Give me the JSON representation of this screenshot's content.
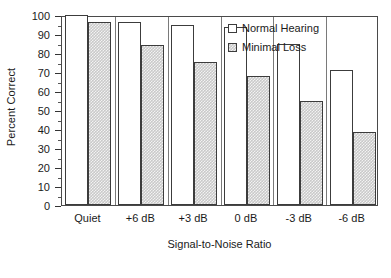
{
  "chart_data": {
    "type": "bar",
    "title": "",
    "xlabel": "Signal-to-Noise Ratio",
    "ylabel": "Percent Correct",
    "categories": [
      "Quiet",
      "+6 dB",
      "+3 dB",
      "0 dB",
      "-3 dB",
      "-6 dB"
    ],
    "series": [
      {
        "name": "Normal Hearing",
        "swatch": "open-square",
        "fill": "#ffffff",
        "values": [
          100,
          96.5,
          95,
          93.5,
          85,
          71
        ]
      },
      {
        "name": "Minimal Loss",
        "swatch": "hatched-square",
        "fill": "#c9c9c9",
        "values": [
          96.5,
          84,
          75.5,
          68,
          54.5,
          38.5
        ]
      }
    ],
    "ylim": [
      0,
      100
    ],
    "ytick_labels": [
      "0",
      "10",
      "20",
      "30",
      "40",
      "50",
      "60",
      "70",
      "80",
      "90",
      "100"
    ],
    "ytick_values": [
      0,
      10,
      20,
      30,
      40,
      50,
      60,
      70,
      80,
      90,
      100
    ],
    "yminor_interval": 5,
    "grid": false,
    "legend_position": "top-right",
    "frame": true,
    "group_separators": true
  },
  "axes": {
    "y_title": "Percent Correct",
    "x_title": "Signal-to-Noise Ratio"
  },
  "legend": {
    "entries": [
      {
        "label": "Normal Hearing"
      },
      {
        "label": "Minimal Loss"
      }
    ]
  },
  "colors": {
    "frame": "#4a4a4a",
    "bar_edge": "#3c3c3c",
    "normal_fill": "#ffffff",
    "loss_fill": "#c9c9c9",
    "text": "#1a1a1a",
    "background": "#ffffff"
  }
}
